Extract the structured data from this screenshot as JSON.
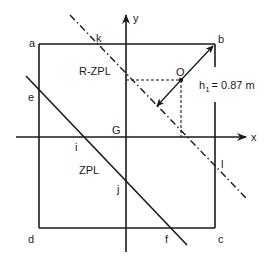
{
  "diagram": {
    "type": "geometry",
    "colors": {
      "line": "#1a1a1a",
      "background": "#ffffff"
    },
    "axes": {
      "x_label": "x",
      "y_label": "y",
      "origin_label": "G"
    },
    "corners": {
      "a": "a",
      "b": "b",
      "c": "c",
      "d": "d"
    },
    "points": {
      "e": "e",
      "f": "f",
      "i": "i",
      "j": "j",
      "k": "k",
      "l": "l",
      "O": "O"
    },
    "lines": {
      "zpl": "ZPL",
      "rzpl": "R-ZPL"
    },
    "dimension": {
      "label": "h",
      "subscript": "1",
      "value": "= 0.87 m"
    }
  }
}
